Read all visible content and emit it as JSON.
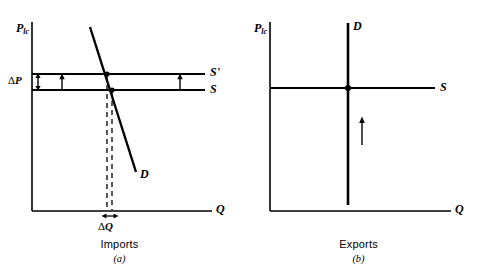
{
  "figure": {
    "type": "economics-supply-demand-diagram",
    "stroke_color": "#000000",
    "background": "#ffffff",
    "panels": [
      {
        "id": "a",
        "caption_name": "Imports",
        "caption_letter": "(a)",
        "axes": {
          "y_label": "P",
          "y_label_sub": "lc",
          "x_label": "Q",
          "origin": {
            "x": 32,
            "y": 211
          },
          "x_axis_end": {
            "x": 212,
            "y": 211
          },
          "y_axis_top": {
            "x": 32,
            "y": 22
          }
        },
        "curves": [
          {
            "name": "supply-shifted",
            "label": "S",
            "label_prime": "'",
            "type": "horizontal-line",
            "y": 74,
            "x_start": 32,
            "x_end": 205
          },
          {
            "name": "supply",
            "label": "S",
            "label_prime": "",
            "type": "horizontal-line",
            "y": 90,
            "x_start": 32,
            "x_end": 205
          },
          {
            "name": "demand",
            "label": "D",
            "type": "steep-downward-line",
            "x1": 90,
            "y1": 27,
            "x2": 136,
            "y2": 172
          }
        ],
        "equilibria": [
          {
            "name": "equilibrium-shifted",
            "x": 107,
            "y": 74
          },
          {
            "name": "equilibrium-initial",
            "x": 112,
            "y": 90
          }
        ],
        "annotations": [
          {
            "name": "delta-p",
            "symbol": "Δ",
            "variable": "P",
            "axis": "vertical",
            "from_y": 74,
            "to_y": 90,
            "x": 38
          },
          {
            "name": "delta-q",
            "symbol": "Δ",
            "variable": "Q",
            "axis": "horizontal",
            "from_x": 107,
            "to_x": 112,
            "y": 216
          },
          {
            "name": "shift-arrow-left",
            "direction": "up",
            "x": 62,
            "from_y": 90,
            "to_y": 74
          },
          {
            "name": "shift-arrow-right",
            "direction": "up",
            "x": 180,
            "from_y": 90,
            "to_y": 74
          }
        ],
        "dashed_drops": [
          {
            "x": 107,
            "from_y": 74,
            "to_y": 211
          },
          {
            "x": 112,
            "from_y": 90,
            "to_y": 211
          }
        ]
      },
      {
        "id": "b",
        "caption_name": "Exports",
        "caption_letter": "(b)",
        "axes": {
          "y_label": "P",
          "y_label_sub": "lc",
          "x_label": "Q",
          "origin": {
            "x": 31,
            "y": 211
          },
          "x_axis_end": {
            "x": 212,
            "y": 211
          },
          "y_axis_top": {
            "x": 31,
            "y": 22
          }
        },
        "curves": [
          {
            "name": "demand",
            "label": "D",
            "type": "vertical-line",
            "x": 109,
            "y_top": 23,
            "y_bottom": 205
          },
          {
            "name": "supply",
            "label": "S",
            "label_prime": "",
            "type": "horizontal-line",
            "y": 88,
            "x_start": 31,
            "x_end": 196
          }
        ],
        "equilibria": [
          {
            "name": "equilibrium",
            "x": 109,
            "y": 88
          }
        ],
        "annotations": [
          {
            "name": "shift-arrow",
            "direction": "up",
            "x": 123,
            "from_y": 145,
            "to_y": 117
          }
        ],
        "dashed_drops": []
      }
    ]
  }
}
